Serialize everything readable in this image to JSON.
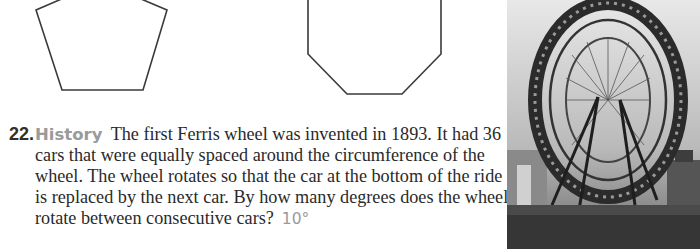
{
  "figures": {
    "pentagon": {
      "label": "pentagon-figure"
    },
    "octagon": {
      "label": "octagon-figure"
    }
  },
  "problem": {
    "number": "22.",
    "topic": "History",
    "lines": [
      "The first Ferris wheel was invented in 1893. It had 36",
      "cars that were equally spaced around the circumference of the",
      "wheel. The wheel rotates so that the car at the bottom of the ride",
      "is replaced by the next car. By how many degrees does the wheel",
      "rotate between consecutive cars?"
    ],
    "answer": "10°"
  },
  "photo": {
    "subject": "ferris-wheel-1893"
  },
  "colors": {
    "text": "#2a2a2a",
    "accent_gray": "#9a9a9a",
    "stroke": "#3a3a3a"
  }
}
